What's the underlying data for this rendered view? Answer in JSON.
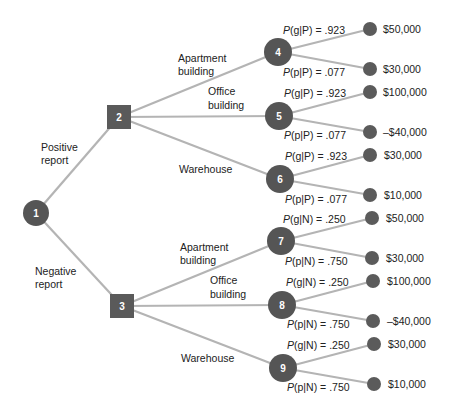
{
  "diagram": {
    "type": "decision-tree",
    "root": {
      "id": "1",
      "shape": "circle",
      "branches": [
        {
          "label_line1": "Positive",
          "label_line2": "report",
          "to": "2"
        },
        {
          "label_line1": "Negative",
          "label_line2": "report",
          "to": "3"
        }
      ]
    },
    "decision_nodes": [
      {
        "id": "2",
        "shape": "square",
        "branches": [
          {
            "label_line1": "Apartment",
            "label_line2": "building",
            "to": "4"
          },
          {
            "label_line1": "Office",
            "label_line2": "building",
            "to": "5"
          },
          {
            "label_line1": "Warehouse",
            "label_line2": "",
            "to": "6"
          }
        ]
      },
      {
        "id": "3",
        "shape": "square",
        "branches": [
          {
            "label_line1": "Apartment",
            "label_line2": "building",
            "to": "7"
          },
          {
            "label_line1": "Office",
            "label_line2": "building",
            "to": "8"
          },
          {
            "label_line1": "Warehouse",
            "label_line2": "",
            "to": "9"
          }
        ]
      }
    ],
    "chance_nodes": [
      {
        "id": "4",
        "good_prob": {
          "prefix": "P",
          "cond": "(g|P) = .923"
        },
        "poor_prob": {
          "prefix": "P",
          "cond": "(p|P) = .077"
        },
        "good_payoff": "$50,000",
        "poor_payoff": "$30,000"
      },
      {
        "id": "5",
        "good_prob": {
          "prefix": "P",
          "cond": "(g|P) = .923"
        },
        "poor_prob": {
          "prefix": "P",
          "cond": "(p|P) = .077"
        },
        "good_payoff": "$100,000",
        "poor_payoff": "–$40,000"
      },
      {
        "id": "6",
        "good_prob": {
          "prefix": "P",
          "cond": "(g|P) = .923"
        },
        "poor_prob": {
          "prefix": "P",
          "cond": "(p|P) = .077"
        },
        "good_payoff": "$30,000",
        "poor_payoff": "$10,000"
      },
      {
        "id": "7",
        "good_prob": {
          "prefix": "P",
          "cond": "(g|N) = .250"
        },
        "poor_prob": {
          "prefix": "P",
          "cond": "(p|N) = .750"
        },
        "good_payoff": "$50,000",
        "poor_payoff": "$30,000"
      },
      {
        "id": "8",
        "good_prob": {
          "prefix": "P",
          "cond": "(g|N) = .250"
        },
        "poor_prob": {
          "prefix": "P",
          "cond": "(p|N) = .750"
        },
        "good_payoff": "$100,000",
        "poor_payoff": "–$40,000"
      },
      {
        "id": "9",
        "good_prob": {
          "prefix": "P",
          "cond": "(g|N) = .250"
        },
        "poor_prob": {
          "prefix": "P",
          "cond": "(p|N) = .750"
        },
        "good_payoff": "$30,000",
        "poor_payoff": "$10,000"
      }
    ]
  },
  "colors": {
    "edge": "#b4b4b4",
    "node_fill": "#555555",
    "node_text": "#ffffff",
    "label_text": "#222222",
    "background": "#ffffff"
  }
}
